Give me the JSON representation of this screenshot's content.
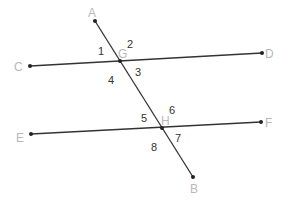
{
  "diagram": {
    "type": "geometry",
    "colors": {
      "line": "#333333",
      "point": "#222222",
      "point_label": "#b8b8b8",
      "angle_label": "#333333"
    },
    "points": {
      "A": {
        "label": "A",
        "x": 95,
        "y": 21
      },
      "B": {
        "label": "B",
        "x": 193,
        "y": 177
      },
      "C": {
        "label": "C",
        "x": 30,
        "y": 66
      },
      "D": {
        "label": "D",
        "x": 262,
        "y": 53
      },
      "E": {
        "label": "E",
        "x": 31,
        "y": 134
      },
      "F": {
        "label": "F",
        "x": 261,
        "y": 122
      },
      "G": {
        "label": "G",
        "x": 120,
        "y": 61
      },
      "H": {
        "label": "H",
        "x": 162,
        "y": 128
      }
    },
    "segments": [
      {
        "from": "C",
        "to": "D"
      },
      {
        "from": "E",
        "to": "F"
      },
      {
        "from": "A",
        "to": "B"
      }
    ],
    "angles": [
      {
        "label": "1",
        "vertex": "G",
        "x": 101,
        "y": 55
      },
      {
        "label": "2",
        "vertex": "G",
        "x": 128,
        "y": 48
      },
      {
        "label": "3",
        "vertex": "G",
        "x": 135,
        "y": 76
      },
      {
        "label": "4",
        "vertex": "G",
        "x": 109,
        "y": 84
      },
      {
        "label": "5",
        "vertex": "H",
        "x": 141,
        "y": 122
      },
      {
        "label": "6",
        "vertex": "H",
        "x": 169,
        "y": 114
      },
      {
        "label": "7",
        "vertex": "H",
        "x": 176,
        "y": 143
      },
      {
        "label": "8",
        "vertex": "H",
        "x": 151,
        "y": 151
      }
    ]
  }
}
